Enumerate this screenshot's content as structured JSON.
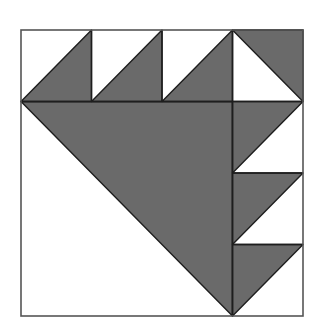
{
  "diagram": {
    "type": "quilt-block",
    "grid": 4,
    "colors": {
      "background": "#ffffff",
      "fill": "#6a6a6a",
      "line": "#1e1e1e",
      "border": "#555555"
    },
    "square": {
      "x": 21,
      "y": 30,
      "w": 282,
      "h": 286
    },
    "big_triangle": {
      "points": [
        [
          0,
          1
        ],
        [
          3,
          1
        ],
        [
          3,
          4
        ]
      ]
    },
    "top_row_cells": [
      {
        "col": 0,
        "dark": [
          [
            0,
            1
          ],
          [
            1,
            0
          ],
          [
            1,
            1
          ]
        ]
      },
      {
        "col": 1,
        "dark": [
          [
            0,
            1
          ],
          [
            1,
            0
          ],
          [
            1,
            1
          ]
        ]
      },
      {
        "col": 2,
        "dark": [
          [
            0,
            1
          ],
          [
            1,
            0
          ],
          [
            1,
            1
          ]
        ]
      },
      {
        "col": 3,
        "dark": [
          [
            0,
            0
          ],
          [
            1,
            0
          ],
          [
            1,
            1
          ]
        ]
      }
    ],
    "right_col_cells": [
      {
        "row": 1,
        "dark": [
          [
            0,
            0
          ],
          [
            1,
            0
          ],
          [
            0,
            1
          ]
        ]
      },
      {
        "row": 2,
        "dark": [
          [
            0,
            0
          ],
          [
            1,
            0
          ],
          [
            0,
            1
          ]
        ]
      },
      {
        "row": 3,
        "dark": [
          [
            0,
            0
          ],
          [
            1,
            0
          ],
          [
            0,
            1
          ]
        ]
      }
    ]
  }
}
